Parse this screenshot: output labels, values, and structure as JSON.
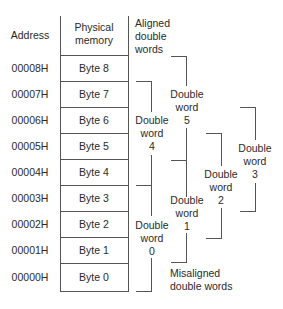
{
  "header": {
    "address_label": "Address",
    "memory_label_line1": "Physical",
    "memory_label_line2": "memory",
    "aligned_label": [
      "Aligned",
      "double",
      "words"
    ]
  },
  "rows": [
    {
      "address": "00008H",
      "byte": "Byte 8"
    },
    {
      "address": "00007H",
      "byte": "Byte 7"
    },
    {
      "address": "00006H",
      "byte": "Byte 6"
    },
    {
      "address": "00005H",
      "byte": "Byte 5"
    },
    {
      "address": "00004H",
      "byte": "Byte 4"
    },
    {
      "address": "00003H",
      "byte": "Byte 3"
    },
    {
      "address": "00002H",
      "byte": "Byte 2"
    },
    {
      "address": "00001H",
      "byte": "Byte 1"
    },
    {
      "address": "00000H",
      "byte": "Byte 0"
    }
  ],
  "double_words": {
    "dw0": {
      "line1": "Double",
      "line2": "word",
      "num": "0",
      "type": "aligned",
      "bytes": "0-3"
    },
    "dw1": {
      "line1": "Double",
      "line2": "word",
      "num": "1",
      "type": "misaligned",
      "bytes": "1-4"
    },
    "dw2": {
      "line1": "Double",
      "line2": "word",
      "num": "2",
      "type": "misaligned",
      "bytes": "2-5"
    },
    "dw3": {
      "line1": "Double",
      "line2": "word",
      "num": "3",
      "type": "misaligned",
      "bytes": "3-6"
    },
    "dw4": {
      "line1": "Double",
      "line2": "word",
      "num": "4",
      "type": "aligned",
      "bytes": "4-7"
    },
    "dw5": {
      "line1": "Double",
      "line2": "word",
      "num": "5",
      "type": "misaligned",
      "bytes": "5-8"
    }
  },
  "misaligned_label": [
    "Misaligned",
    "double words"
  ],
  "colors": {
    "line": "#555555",
    "text": "#2a2a2a",
    "background": "#ffffff"
  }
}
